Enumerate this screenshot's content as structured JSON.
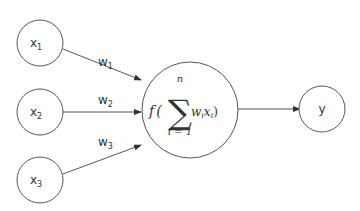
{
  "diagram": {
    "type": "perceptron",
    "inputs": [
      {
        "id": "x1",
        "base": "x",
        "sub": "1",
        "weight_base": "w",
        "weight_sub": "1"
      },
      {
        "id": "x2",
        "base": "x",
        "sub": "2",
        "weight_base": "w",
        "weight_sub": "2"
      },
      {
        "id": "x3",
        "base": "x",
        "sub": "3",
        "weight_base": "w",
        "weight_sub": "3"
      }
    ],
    "neuron": {
      "func": "f",
      "open_paren": "(",
      "close_paren": ")",
      "sum_symbol": "∑",
      "sum_upper": "n",
      "sum_lower": "i = 1",
      "term_w": "w",
      "term_w_sub": "i",
      "term_x": "x",
      "term_x_sub": "i"
    },
    "output": {
      "label": "y"
    },
    "colors": {
      "stroke": "#555555",
      "text": "#333333",
      "background": "#ffffff"
    }
  }
}
